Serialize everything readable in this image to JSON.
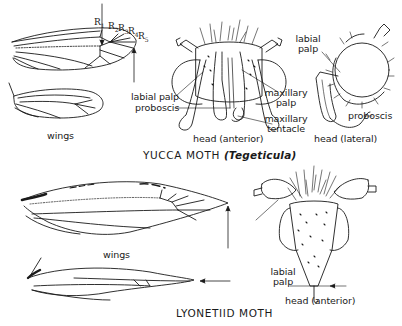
{
  "figure": {
    "sections": [
      {
        "title": "YUCCA MOTH",
        "genus": "(Tegeticula)",
        "wings": {
          "label": "wings",
          "vein_labels": [
            "R1",
            "R2",
            "R3",
            "R4",
            "R5"
          ]
        },
        "head_anterior": {
          "caption": "head (anterior)",
          "labels": [
            "labial palp",
            "proboscis",
            "maxillary palp",
            "maxillary tentacle"
          ]
        },
        "head_lateral": {
          "caption": "head (lateral)",
          "labels": [
            "labial palp",
            "proboscis"
          ]
        }
      },
      {
        "title": "LYONETIID MOTH",
        "wings": {
          "label": "wings"
        },
        "head_anterior": {
          "caption": "head (anterior)",
          "labels": [
            "labial palp"
          ]
        }
      }
    ]
  },
  "labels": {
    "yucca_title": "YUCCA MOTH",
    "yucca_genus": "(Tegeticula)",
    "yucca_wings": "wings",
    "r1": "R",
    "r1_sub": "1",
    "r2": "R",
    "r2_sub": "2",
    "r3": "R",
    "r3_sub": "3",
    "r4": "R",
    "r4_sub": "4",
    "r5": "R",
    "r5_sub": "5",
    "ant_labial_palp": "labial palp",
    "ant_proboscis": "proboscis",
    "ant_max_palp_1": "maxillary",
    "ant_max_palp_2": "palp",
    "ant_max_tent_1": "maxillary",
    "ant_max_tent_2": "tentacle",
    "ant_caption": "head (anterior)",
    "lat_labial_1": "labial",
    "lat_labial_2": "palp",
    "lat_proboscis": "proboscis",
    "lat_caption": "head (lateral)",
    "lyo_title": "LYONETIID MOTH",
    "lyo_wings": "wings",
    "lyo_labial_1": "labial",
    "lyo_labial_2": "palp",
    "lyo_caption": "head (anterior)"
  }
}
